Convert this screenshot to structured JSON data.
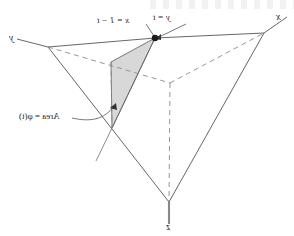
{
  "figure": {
    "stroke_color": "#555555",
    "dashed_color": "#8a8a8a",
    "shade_fill": "#d8d8d8",
    "shade_stroke": "#6b6b6b",
    "background": "#ffffff",
    "mirrored": true
  },
  "axes": [
    {
      "name": "y-axis",
      "label": "y",
      "x": 9,
      "y": 33
    },
    {
      "name": "x-axis",
      "label": "x",
      "x": 276,
      "y": 12
    },
    {
      "name": "z-axis",
      "label": "z",
      "x": 166,
      "y": 222
    }
  ],
  "annotations": [
    {
      "name": "x-equation",
      "label": "x = 1 − t",
      "x": 97,
      "y": 16
    },
    {
      "name": "y-equation",
      "label": "y = t",
      "x": 153,
      "y": 13
    },
    {
      "name": "area-function",
      "label": "Area = φ(t)",
      "x": 19,
      "y": 112
    }
  ],
  "geometry": {
    "vertex_x_axis_tip": [
      288,
      16
    ],
    "vertex_y_axis_tip": [
      14,
      38
    ],
    "vertex_z_axis_tip": [
      169,
      228
    ],
    "corner_left": [
      48,
      47
    ],
    "corner_right": [
      264,
      33
    ],
    "corner_bottom": [
      169,
      202
    ],
    "origin_hidden": [
      170,
      83
    ],
    "cut_point": [
      155,
      38
    ],
    "tri_upper_left": [
      111,
      62
    ],
    "tri_bottom": [
      112,
      128
    ]
  },
  "shaded_region": {
    "name": "cross-section-triangle",
    "points": "155,38 111,62 112,128",
    "fill": "#d8d8d8"
  },
  "marker": {
    "name": "cut-point-dot",
    "x": 155,
    "y": 38,
    "radius": 3.2
  }
}
